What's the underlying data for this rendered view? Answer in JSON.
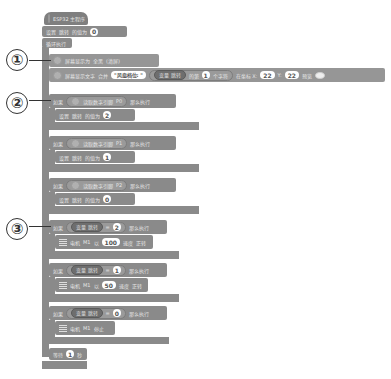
{
  "program": {
    "hat": {
      "label": "ESP32 主程序"
    },
    "init_set": {
      "set": "设置",
      "var": "跳转",
      "to": "的值为",
      "value": "0"
    },
    "loop": {
      "label": "循环执行"
    },
    "screen_clear": {
      "label": "屏幕显示为",
      "option": "全黑",
      "suffix": "(清屏)"
    },
    "screen_text": {
      "label": "屏幕显示文字",
      "merge": "合并",
      "text": "\"风扇档位: \"",
      "var_label": "变量 跳转",
      "nth": "的第",
      "index": "1",
      "char": "个字符",
      "at": "在坐标 X:",
      "x": "22",
      "y_label": "Y:",
      "y": "22",
      "preview": "预览"
    },
    "digital_ifs": [
      {
        "if": "如果",
        "read": "读取数字引脚",
        "pin": "P0",
        "then": "那么执行",
        "set": "设置",
        "var": "跳转",
        "to": "的值为",
        "value": "2"
      },
      {
        "if": "如果",
        "read": "读取数字引脚",
        "pin": "P1",
        "then": "那么执行",
        "set": "设置",
        "var": "跳转",
        "to": "的值为",
        "value": "1"
      },
      {
        "if": "如果",
        "read": "读取数字引脚",
        "pin": "P2",
        "then": "那么执行",
        "set": "设置",
        "var": "跳转",
        "to": "的值为",
        "value": "0"
      }
    ],
    "motor_ifs": [
      {
        "if": "如果",
        "var": "变量 跳转",
        "eq": "=",
        "value": "2",
        "then": "那么执行",
        "motor": "电机",
        "port": "M1",
        "action_prefix": "以",
        "speed": "100",
        "speed_label": "速度",
        "direction": "正转"
      },
      {
        "if": "如果",
        "var": "变量 跳转",
        "eq": "=",
        "value": "1",
        "then": "那么执行",
        "motor": "电机",
        "port": "M1",
        "action_prefix": "以",
        "speed": "50",
        "speed_label": "速度",
        "direction": "正转"
      },
      {
        "if": "如果",
        "var": "变量 跳转",
        "eq": "=",
        "value": "0",
        "then": "那么执行",
        "motor": "电机",
        "port": "M1",
        "stop": "停止"
      }
    ],
    "wait": {
      "label": "等待",
      "value": "1",
      "unit": "秒"
    }
  },
  "callouts": [
    "①",
    "②",
    "③"
  ]
}
